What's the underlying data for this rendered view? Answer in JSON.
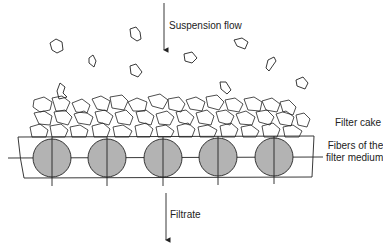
{
  "labels": {
    "suspension_flow": "Suspension flow",
    "filter_cake": "Filter cake",
    "fibers_line1": "Fibers of the",
    "fibers_line2": "filter medium",
    "filtrate": "Filtrate"
  },
  "colors": {
    "fiber_fill": "#b3b3b3",
    "stroke": "#222222"
  },
  "fibers": {
    "count": 5,
    "centers_x": [
      52,
      107,
      163,
      218,
      274
    ],
    "center_y": 158,
    "radius": 19
  }
}
